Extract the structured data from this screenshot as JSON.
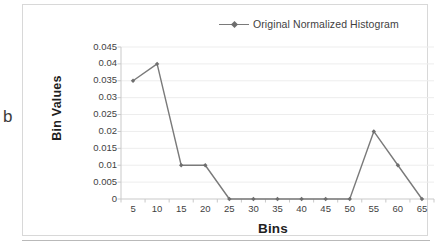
{
  "panel": {
    "letter": "b"
  },
  "legend": {
    "entries": [
      {
        "label": "Original Normalized Histogram",
        "color": "#7a7a7a",
        "marker": "diamond"
      }
    ],
    "position": "top-center"
  },
  "axis_titles": {
    "x": "Bins",
    "y": "Bin Values"
  },
  "ticks": {
    "y": [
      "0.045",
      "0.04",
      "0.035",
      "0.03",
      "0.025",
      "0.02",
      "0.015",
      "0.01",
      "0.005",
      "0"
    ],
    "x": [
      "5",
      "10",
      "15",
      "20",
      "25",
      "30",
      "35",
      "40",
      "45",
      "50",
      "55",
      "60",
      "65"
    ]
  },
  "chart_data": {
    "type": "line",
    "title": "",
    "xlabel": "Bins",
    "ylabel": "Bin Values",
    "categories": [
      5,
      10,
      15,
      20,
      25,
      30,
      35,
      40,
      45,
      50,
      55,
      60,
      65
    ],
    "series": [
      {
        "name": "Original Normalized Histogram",
        "color": "#7a7a7a",
        "marker": "diamond",
        "values": [
          0.035,
          0.04,
          0.01,
          0.01,
          0,
          0,
          0,
          0,
          0,
          0,
          0.02,
          0.01,
          0
        ]
      }
    ],
    "ylim": [
      0,
      0.045
    ],
    "ytick_step": 0.005,
    "yticks": [
      0,
      0.005,
      0.01,
      0.015,
      0.02,
      0.025,
      0.03,
      0.035,
      0.04,
      0.045
    ],
    "xticks": [
      5,
      10,
      15,
      20,
      25,
      30,
      35,
      40,
      45,
      50,
      55,
      60,
      65
    ],
    "grid": {
      "horizontal": true,
      "vertical": false,
      "color": "#ededed"
    },
    "legend_position": "top-center",
    "colors": {
      "line": "#7a7a7a",
      "marker": "#6e6e6e",
      "grid": "#ededed",
      "axis": "#c9c9c9"
    }
  }
}
